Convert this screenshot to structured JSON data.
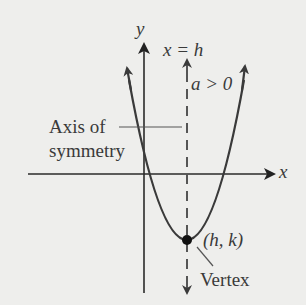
{
  "labels": {
    "y_axis": "y",
    "x_axis": "x",
    "axis_equation": "x = h",
    "condition": "a > 0",
    "axis_of_symmetry_line1": "Axis of",
    "axis_of_symmetry_line2": "symmetry",
    "vertex_coords": "(h, k)",
    "vertex": "Vertex"
  },
  "colors": {
    "background": "#eeeeec",
    "ink": "#3a3a3a",
    "vertex_dot": "#111111"
  },
  "geometry": {
    "origin": [
      144,
      174
    ],
    "vertex": [
      187,
      240
    ],
    "axis_of_symmetry_x": 187,
    "parabola_opens": "up"
  }
}
